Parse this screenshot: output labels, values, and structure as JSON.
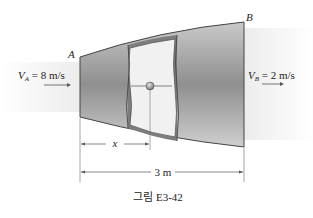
{
  "figure": {
    "caption": "그림 E3-42",
    "point_a_label": "A",
    "point_b_label": "B",
    "inlet_velocity": {
      "symbol": "V",
      "subscript": "A",
      "value_text": " = 8 m/s"
    },
    "outlet_velocity": {
      "symbol": "V",
      "subscript": "B",
      "value_text": " = 2 m/s"
    },
    "dimension_x": "x",
    "dimension_length": "3 m"
  }
}
